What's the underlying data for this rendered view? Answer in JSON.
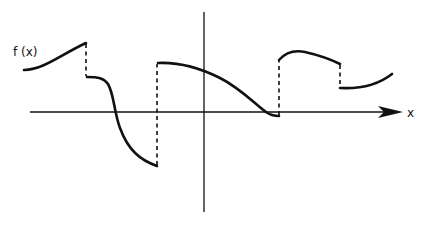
{
  "diagram": {
    "y_label": "f (x)",
    "x_label": "x",
    "pieces": 5,
    "discontinuities": 4,
    "colors": {
      "ink": "#111111",
      "background": "#ffffff"
    }
  }
}
